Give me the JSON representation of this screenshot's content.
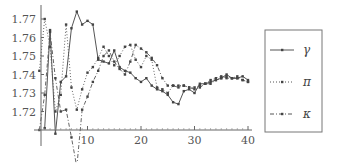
{
  "chart_data": {
    "type": "line",
    "title": "",
    "xlabel": "",
    "ylabel": "",
    "xlim": [
      0,
      40
    ],
    "ylim": [
      1.71,
      1.775
    ],
    "x_ticks": [
      10,
      20,
      30,
      40
    ],
    "y_ticks": [
      1.72,
      1.73,
      1.74,
      1.75,
      1.76,
      1.77
    ],
    "grid": false,
    "legend_position": "right",
    "series": [
      {
        "name": "γ",
        "style": "solid",
        "x": [
          2,
          3,
          4,
          5,
          6,
          7,
          8,
          9,
          10,
          11,
          12,
          13,
          14,
          15,
          16,
          17,
          18,
          19,
          20,
          21,
          22,
          23,
          24,
          25,
          26,
          27,
          28,
          29,
          30,
          31,
          32,
          33,
          34,
          35,
          36,
          37,
          38,
          39,
          40
        ],
        "values": [
          1.711,
          1.764,
          1.708,
          1.736,
          1.739,
          1.765,
          1.774,
          1.767,
          1.769,
          1.767,
          1.748,
          1.747,
          1.746,
          1.753,
          1.744,
          1.742,
          1.741,
          1.738,
          1.736,
          1.738,
          1.734,
          1.732,
          1.731,
          1.729,
          1.725,
          1.724,
          1.731,
          1.732,
          1.73,
          1.735,
          1.735,
          1.736,
          1.737,
          1.738,
          1.74,
          1.738,
          1.738,
          1.739,
          1.737
        ]
      },
      {
        "name": "π",
        "style": "dotted",
        "x": [
          1,
          2,
          3,
          4,
          5,
          6,
          7,
          8,
          9,
          10,
          11,
          12,
          13,
          14,
          15,
          16,
          17,
          18,
          19,
          20,
          21,
          22,
          23,
          24,
          25,
          26,
          27,
          28,
          29,
          30,
          31,
          32,
          33,
          34,
          35,
          36,
          37,
          38,
          39,
          40
        ],
        "values": [
          1.742,
          1.77,
          1.755,
          1.72,
          1.729,
          1.767,
          1.733,
          1.721,
          1.732,
          1.741,
          1.744,
          1.749,
          1.755,
          1.75,
          1.745,
          1.75,
          1.755,
          1.756,
          1.748,
          1.744,
          1.75,
          1.748,
          1.733,
          1.732,
          1.73,
          1.734,
          1.734,
          1.734,
          1.733,
          1.733,
          1.734,
          1.735,
          1.737,
          1.738,
          1.739,
          1.738,
          1.738,
          1.739,
          1.737,
          1.736
        ]
      },
      {
        "name": "κ",
        "style": "dash-dot",
        "x": [
          1,
          2,
          3,
          4,
          5,
          6,
          7,
          8,
          9,
          10,
          11,
          12,
          13,
          14,
          15,
          16,
          17,
          18,
          19,
          20,
          21,
          22,
          23,
          24,
          25,
          26,
          27,
          28,
          29,
          30,
          31,
          32,
          33,
          34,
          35,
          36,
          37,
          38,
          39,
          40
        ],
        "values": [
          1.71,
          1.729,
          1.763,
          1.738,
          1.72,
          1.721,
          1.706,
          1.69,
          1.721,
          1.728,
          1.736,
          1.742,
          1.75,
          1.753,
          1.747,
          1.743,
          1.74,
          1.747,
          1.756,
          1.754,
          1.752,
          1.749,
          1.745,
          1.738,
          1.734,
          1.734,
          1.733,
          1.734,
          1.733,
          1.732,
          1.733,
          1.735,
          1.735,
          1.737,
          1.738,
          1.739,
          1.738,
          1.738,
          1.737,
          1.736
        ]
      }
    ]
  },
  "legend": {
    "items": [
      {
        "label": "γ",
        "style": "solid"
      },
      {
        "label": "π",
        "style": "dotted"
      },
      {
        "label": "κ",
        "style": "dash-dot"
      }
    ]
  },
  "axes": {
    "x_tick_labels": [
      "10",
      "20",
      "30",
      "40"
    ],
    "y_tick_labels": [
      "1.72",
      "1.73",
      "1.74",
      "1.75",
      "1.76",
      "1.77"
    ]
  }
}
